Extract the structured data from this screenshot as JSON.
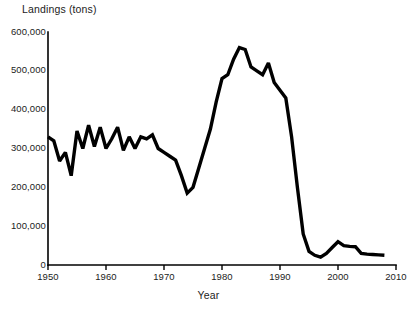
{
  "chart_data": {
    "type": "line",
    "title": "",
    "ylabel": "Landings (tons)",
    "xlabel": "Year",
    "xlim": [
      1950,
      2010
    ],
    "ylim": [
      0,
      600000
    ],
    "grid": false,
    "legend": "none",
    "xticks": [
      1950,
      1960,
      1970,
      1980,
      1990,
      2000,
      2010
    ],
    "xtick_labels": [
      "1950",
      "1960",
      "1970",
      "1980",
      "1990",
      "2000",
      "2010"
    ],
    "yticks": [
      0,
      100000,
      200000,
      300000,
      400000,
      500000,
      600000
    ],
    "ytick_labels": [
      "0",
      "100,000",
      "200,000",
      "300,000",
      "400,000",
      "500,000",
      "600,000"
    ],
    "series": [
      {
        "name": "Landings",
        "color": "#000000",
        "x": [
          1950,
          1951,
          1952,
          1953,
          1954,
          1955,
          1956,
          1957,
          1958,
          1959,
          1960,
          1961,
          1962,
          1963,
          1964,
          1965,
          1966,
          1967,
          1968,
          1969,
          1970,
          1971,
          1972,
          1973,
          1974,
          1975,
          1976,
          1977,
          1978,
          1979,
          1980,
          1981,
          1982,
          1983,
          1984,
          1985,
          1986,
          1987,
          1988,
          1989,
          1990,
          1991,
          1992,
          1993,
          1994,
          1995,
          1996,
          1997,
          1998,
          1999,
          2000,
          2001,
          2002,
          2003,
          2004,
          2005,
          2006,
          2007,
          2008
        ],
        "y": [
          330000,
          320000,
          268000,
          290000,
          230000,
          345000,
          300000,
          360000,
          305000,
          355000,
          300000,
          325000,
          355000,
          295000,
          330000,
          300000,
          330000,
          325000,
          335000,
          300000,
          290000,
          280000,
          270000,
          230000,
          185000,
          200000,
          250000,
          300000,
          350000,
          420000,
          480000,
          490000,
          530000,
          560000,
          555000,
          510000,
          500000,
          490000,
          520000,
          470000,
          450000,
          430000,
          330000,
          200000,
          80000,
          35000,
          25000,
          20000,
          30000,
          45000,
          60000,
          50000,
          48000,
          47000,
          30000,
          28000,
          27000,
          26000,
          25000
        ]
      }
    ]
  },
  "axes": {
    "y_title": "Landings (tons)",
    "x_title": "Year"
  }
}
